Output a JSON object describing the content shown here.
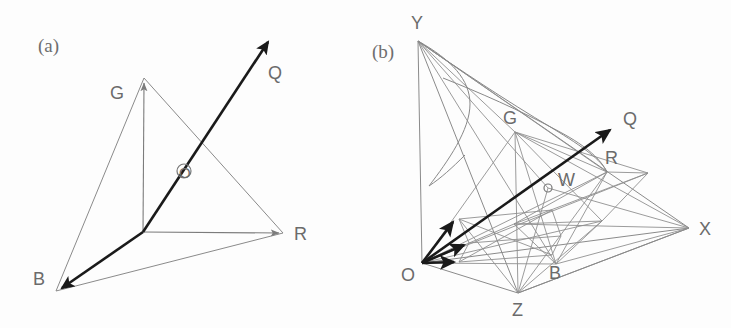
{
  "figure": {
    "background_color": "#fdfdfd",
    "line_color": "#8a8a8a",
    "bold_color": "#1a1a1a",
    "label_color": "#6b6b6b",
    "width": 731,
    "height": 328
  },
  "panel_a": {
    "tag": "(a)",
    "tag_pos": {
      "x": 38,
      "y": 52
    },
    "description": "RGB primary vector basis with resultant color vector Q and chromaticity plane triangle",
    "origin": {
      "x": 143,
      "y": 232,
      "label": ""
    },
    "vectors": [
      {
        "name": "R",
        "label": "R",
        "tip": {
          "x": 283,
          "y": 233
        },
        "label_pos": {
          "x": 294,
          "y": 240
        },
        "style": "thin"
      },
      {
        "name": "G",
        "label": "G",
        "tip": {
          "x": 144,
          "y": 78
        },
        "label_pos": {
          "x": 110,
          "y": 99
        },
        "style": "thin"
      },
      {
        "name": "B",
        "label": "B",
        "tip": {
          "x": 56,
          "y": 291
        },
        "label_pos": {
          "x": 33,
          "y": 285
        },
        "style": "bold"
      },
      {
        "name": "Q",
        "label": "Q",
        "tip": {
          "x": 272,
          "y": 37
        },
        "label_pos": {
          "x": 268,
          "y": 79
        },
        "style": "bold"
      }
    ],
    "triangle": {
      "name": "unit-plane-triangle",
      "points": "144,78 283,233 56,291"
    },
    "marked_point": {
      "name": "O",
      "label": "O",
      "pos": {
        "x": 184,
        "y": 170
      },
      "radius": 7,
      "label_pos": {
        "x": 180,
        "y": 177
      }
    }
  },
  "panel_b": {
    "tag": "(b)",
    "tag_pos": {
      "x": 372,
      "y": 58
    },
    "description": "CIE XYZ tristimulus space containing the RGB cube, spectral locus cone and white point W",
    "origin": {
      "x": 422,
      "y": 263,
      "label": "O",
      "label_pos": {
        "x": 401,
        "y": 281
      }
    },
    "axes": [
      {
        "name": "X",
        "label": "X",
        "tip": {
          "x": 689,
          "y": 228
        },
        "label_pos": {
          "x": 699,
          "y": 235
        }
      },
      {
        "name": "Y",
        "label": "Y",
        "tip": {
          "x": 418,
          "y": 41
        },
        "label_pos": {
          "x": 411,
          "y": 29
        }
      },
      {
        "name": "Z",
        "label": "Z",
        "tip": {
          "x": 518,
          "y": 293
        },
        "label_pos": {
          "x": 512,
          "y": 316
        }
      }
    ],
    "rgb_vectors": [
      {
        "name": "R",
        "label": "R",
        "tip": {
          "x": 607,
          "y": 172
        },
        "label_pos": {
          "x": 605,
          "y": 164
        }
      },
      {
        "name": "G",
        "label": "G",
        "tip": {
          "x": 515,
          "y": 132
        },
        "label_pos": {
          "x": 503,
          "y": 124
        }
      },
      {
        "name": "B",
        "label": "B",
        "tip": {
          "x": 556,
          "y": 264
        },
        "label_pos": {
          "x": 549,
          "y": 279
        }
      }
    ],
    "bold_arrows": [
      {
        "name": "primary-arrow-1",
        "tip": {
          "x": 458,
          "y": 219
        }
      },
      {
        "name": "primary-arrow-2",
        "tip": {
          "x": 469,
          "y": 243
        }
      },
      {
        "name": "primary-arrow-3",
        "tip": {
          "x": 459,
          "y": 262
        }
      }
    ],
    "q_vector": {
      "name": "Q",
      "label": "Q",
      "tip": {
        "x": 614,
        "y": 126
      },
      "label_pos": {
        "x": 623,
        "y": 125
      }
    },
    "white_point": {
      "name": "W",
      "label": "W",
      "pos": {
        "x": 548,
        "y": 188
      },
      "radius": 4,
      "label_pos": {
        "x": 558,
        "y": 186
      }
    },
    "xyz_triangle": {
      "name": "xyz-unit-plane",
      "points": "418,41 689,228 518,293"
    },
    "rgb_triangle": {
      "name": "rgb-unit-plane",
      "points": "515,132 607,172 556,264"
    },
    "spectral_locus": {
      "name": "spectral-locus-cone",
      "path": "M 418,41 C 455,62 487,88 528,112 C 566,134 592,152 601,166"
    }
  }
}
